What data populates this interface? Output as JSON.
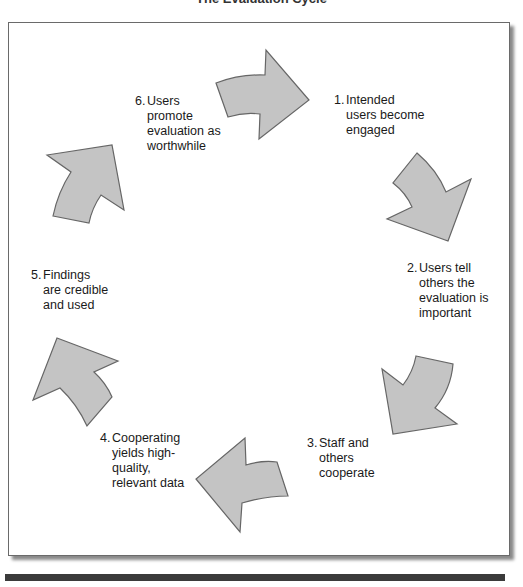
{
  "title": "The Evaluation Cycle",
  "colors": {
    "arrow_fill": "#c4c4c4",
    "arrow_stroke": "#666666",
    "frame_border": "#6a6a6a",
    "bottom_bar": "#3b3b3b"
  },
  "steps": [
    {
      "number": "1.",
      "text": "Intended\nusers become\nengaged"
    },
    {
      "number": "2.",
      "text": "Users tell\nothers the\nevaluation is\nimportant"
    },
    {
      "number": "3.",
      "text": "Staff and\nothers\ncooperate"
    },
    {
      "number": "4.",
      "text": "Cooperating\nyields high-\nquality,\nrelevant data"
    },
    {
      "number": "5.",
      "text": "Findings\nare credible\nand used"
    },
    {
      "number": "6.",
      "text": "Users\npromote\nevaluation as\nworthwhile"
    }
  ],
  "arrows": [
    {
      "name": "arrow-1-to-2",
      "direction": "right"
    },
    {
      "name": "arrow-2-to-3",
      "direction": "down-right"
    },
    {
      "name": "arrow-3-to-4",
      "direction": "down-left"
    },
    {
      "name": "arrow-4-to-5",
      "direction": "left"
    },
    {
      "name": "arrow-5-to-6",
      "direction": "up-left"
    },
    {
      "name": "arrow-6-to-1",
      "direction": "up-right"
    }
  ]
}
